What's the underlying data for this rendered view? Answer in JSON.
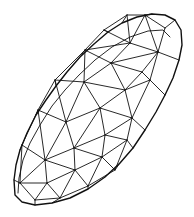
{
  "diagram": {
    "stroke_color": "#111111",
    "background_color": "#ffffff",
    "outline": [
      [
        15,
        195
      ],
      [
        14,
        180
      ],
      [
        16,
        165
      ],
      [
        20,
        150
      ],
      [
        27,
        133
      ],
      [
        36,
        115
      ],
      [
        46,
        100
      ],
      [
        56,
        86
      ],
      [
        67,
        72
      ],
      [
        80,
        57
      ],
      [
        94,
        44
      ],
      [
        108,
        32
      ],
      [
        122,
        23
      ],
      [
        137,
        17
      ],
      [
        152,
        14
      ],
      [
        165,
        15
      ],
      [
        175,
        20
      ],
      [
        181,
        30
      ],
      [
        182,
        45
      ],
      [
        179,
        60
      ],
      [
        173,
        78
      ],
      [
        165,
        95
      ],
      [
        156,
        112
      ],
      [
        145,
        130
      ],
      [
        133,
        148
      ],
      [
        120,
        163
      ],
      [
        105,
        177
      ],
      [
        88,
        189
      ],
      [
        70,
        198
      ],
      [
        52,
        203
      ],
      [
        35,
        205
      ],
      [
        22,
        202
      ]
    ],
    "inner_outline": [
      [
        18,
        193
      ],
      [
        19,
        178
      ],
      [
        23,
        160
      ],
      [
        30,
        143
      ],
      [
        40,
        125
      ],
      [
        52,
        106
      ],
      [
        65,
        90
      ],
      [
        79,
        75
      ],
      [
        95,
        60
      ],
      [
        112,
        47
      ],
      [
        130,
        37
      ],
      [
        148,
        31
      ],
      [
        163,
        30
      ],
      [
        170,
        37
      ]
    ],
    "vertices": [
      [
        104,
        30
      ],
      [
        127,
        15
      ],
      [
        145,
        15
      ],
      [
        165,
        28
      ],
      [
        130,
        43
      ],
      [
        158,
        52
      ],
      [
        85,
        50
      ],
      [
        111,
        63
      ],
      [
        142,
        72
      ],
      [
        55,
        80
      ],
      [
        84,
        82
      ],
      [
        125,
        90
      ],
      [
        150,
        80
      ],
      [
        38,
        110
      ],
      [
        66,
        122
      ],
      [
        100,
        108
      ],
      [
        132,
        118
      ],
      [
        22,
        145
      ],
      [
        45,
        160
      ],
      [
        74,
        148
      ],
      [
        105,
        135
      ],
      [
        127,
        140
      ],
      [
        20,
        183
      ],
      [
        47,
        183
      ],
      [
        75,
        170
      ],
      [
        102,
        157
      ],
      [
        35,
        200
      ],
      [
        60,
        198
      ],
      [
        88,
        186
      ],
      [
        115,
        170
      ]
    ],
    "edges": [
      [
        0,
        1
      ],
      [
        1,
        2
      ],
      [
        2,
        3
      ],
      [
        0,
        4
      ],
      [
        1,
        4
      ],
      [
        2,
        4
      ],
      [
        2,
        5
      ],
      [
        3,
        5
      ],
      [
        4,
        5
      ],
      [
        0,
        6
      ],
      [
        4,
        6
      ],
      [
        4,
        7
      ],
      [
        6,
        7
      ],
      [
        5,
        7
      ],
      [
        5,
        8
      ],
      [
        7,
        8
      ],
      [
        6,
        9
      ],
      [
        6,
        10
      ],
      [
        7,
        10
      ],
      [
        9,
        10
      ],
      [
        7,
        11
      ],
      [
        8,
        11
      ],
      [
        10,
        11
      ],
      [
        8,
        12
      ],
      [
        11,
        12
      ],
      [
        5,
        12
      ],
      [
        9,
        13
      ],
      [
        9,
        14
      ],
      [
        10,
        14
      ],
      [
        13,
        14
      ],
      [
        10,
        15
      ],
      [
        11,
        15
      ],
      [
        14,
        15
      ],
      [
        11,
        16
      ],
      [
        12,
        16
      ],
      [
        15,
        16
      ],
      [
        13,
        17
      ],
      [
        13,
        18
      ],
      [
        14,
        18
      ],
      [
        17,
        18
      ],
      [
        14,
        19
      ],
      [
        15,
        19
      ],
      [
        18,
        19
      ],
      [
        15,
        20
      ],
      [
        16,
        20
      ],
      [
        19,
        20
      ],
      [
        16,
        21
      ],
      [
        20,
        21
      ],
      [
        17,
        22
      ],
      [
        18,
        22
      ],
      [
        18,
        23
      ],
      [
        22,
        23
      ],
      [
        18,
        24
      ],
      [
        19,
        24
      ],
      [
        23,
        24
      ],
      [
        19,
        25
      ],
      [
        20,
        25
      ],
      [
        24,
        25
      ],
      [
        21,
        25
      ],
      [
        22,
        26
      ],
      [
        23,
        26
      ],
      [
        23,
        27
      ],
      [
        26,
        27
      ],
      [
        24,
        27
      ],
      [
        24,
        28
      ],
      [
        27,
        28
      ],
      [
        25,
        28
      ],
      [
        25,
        29
      ],
      [
        28,
        29
      ],
      [
        21,
        29
      ]
    ]
  }
}
